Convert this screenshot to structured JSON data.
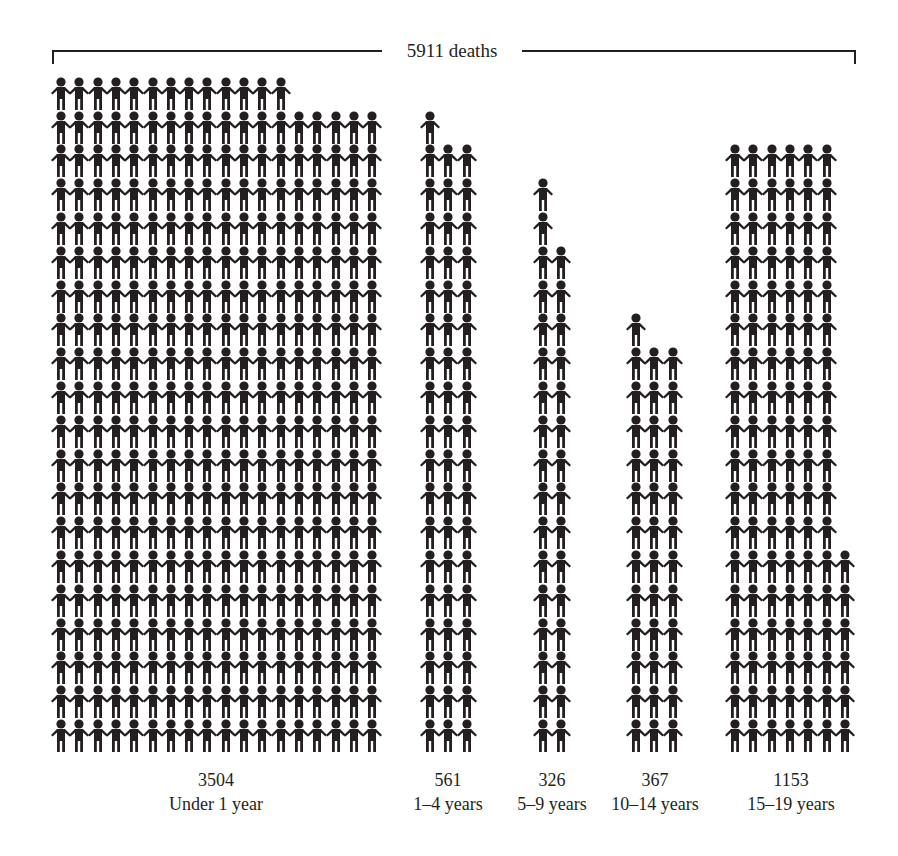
{
  "chart_data": {
    "type": "pictogram",
    "title": "5911 deaths",
    "unit_per_icon": 10,
    "icon": "person-holding-hands-icon",
    "color": "#231f20",
    "categories": [
      "Under 1 year",
      "1–4 years",
      "5–9 years",
      "10–14 years",
      "15–19 years"
    ],
    "values": [
      3504,
      561,
      326,
      367,
      1153
    ],
    "total": 5911,
    "groups": [
      {
        "value_label": "3504",
        "category_label": "Under 1 year",
        "x0": 52,
        "cols": 18,
        "rows": 20,
        "row_counts_top_down": [
          13
        ]
      },
      {
        "value_label": "561",
        "category_label": "1–4 years",
        "x0": 421,
        "cols": 3,
        "rows": 19,
        "row_counts_top_down": [
          1
        ]
      },
      {
        "value_label": "326",
        "category_label": "5–9 years",
        "x0": 534,
        "cols": 2,
        "rows": 17,
        "row_counts_top_down": [
          1,
          1
        ]
      },
      {
        "value_label": "367",
        "category_label": "10–14 years",
        "x0": 627,
        "cols": 3,
        "rows": 13,
        "row_counts_top_down": [
          1
        ]
      },
      {
        "value_label": "1153",
        "category_label": "15–19 years",
        "x0": 726,
        "cols": 7,
        "rows": 18,
        "row_counts_top_down": [
          6,
          6,
          6,
          6,
          6,
          6,
          6,
          6,
          6,
          6,
          6,
          6
        ]
      }
    ]
  },
  "header": {
    "total_label": "5911 deaths"
  },
  "labels": [
    {
      "value": "3504",
      "category": "Under 1 year",
      "center_x": 216
    },
    {
      "value": "561",
      "category": "1–4 years",
      "center_x": 448
    },
    {
      "value": "326",
      "category": "5–9 years",
      "center_x": 552
    },
    {
      "value": "367",
      "category": "10–14 years",
      "center_x": 655
    },
    {
      "value": "1153",
      "category": "15–19 years",
      "center_x": 791
    }
  ]
}
